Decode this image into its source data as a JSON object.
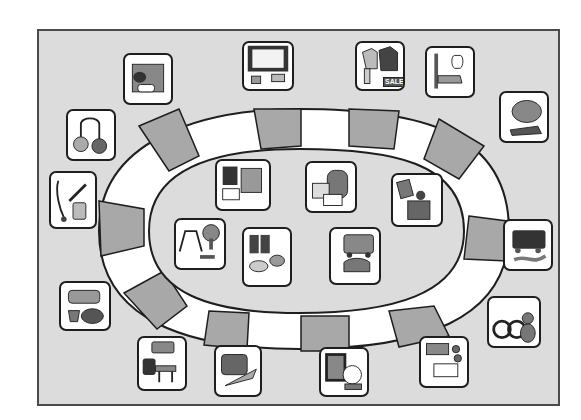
{
  "board": {
    "description": "Board game with oval track of alternating gray and white spaces, picture tiles around it",
    "colors": {
      "background": "#dcdcdc",
      "space_dark": "#a8a8a8",
      "space_light": "#ffffff",
      "outline": "#1e1e1e",
      "frame": "#4a4a4a"
    }
  },
  "outer_tiles": [
    {
      "id": "newsstand",
      "icon": "newsstand-icon"
    },
    {
      "id": "atm",
      "icon": "atm-icon"
    },
    {
      "id": "clothing-sale",
      "icon": "clothing-sale-icon",
      "label": "SALE"
    },
    {
      "id": "toothbrush-toothpaste",
      "icon": "dental-icon"
    },
    {
      "id": "zoo-animals",
      "icon": "zoo-animals-icon"
    },
    {
      "id": "laundromat",
      "icon": "laundry-icon"
    },
    {
      "id": "pharmacy",
      "icon": "pharmacy-icon"
    },
    {
      "id": "fire-truck",
      "icon": "fire-truck-icon"
    },
    {
      "id": "toy-store",
      "icon": "toys-icon"
    },
    {
      "id": "police",
      "icon": "police-icon"
    },
    {
      "id": "school",
      "icon": "school-icon"
    },
    {
      "id": "airport",
      "icon": "airport-icon"
    },
    {
      "id": "museum",
      "icon": "museum-icon"
    },
    {
      "id": "bank",
      "icon": "bank-icon"
    }
  ],
  "inner_tiles": [
    {
      "id": "library",
      "icon": "library-icon"
    },
    {
      "id": "post-office",
      "icon": "post-office-icon"
    },
    {
      "id": "grocery",
      "icon": "grocery-icon"
    },
    {
      "id": "park",
      "icon": "park-icon"
    },
    {
      "id": "shoe-store",
      "icon": "shoe-store-icon"
    },
    {
      "id": "hospital",
      "icon": "hospital-icon"
    }
  ]
}
